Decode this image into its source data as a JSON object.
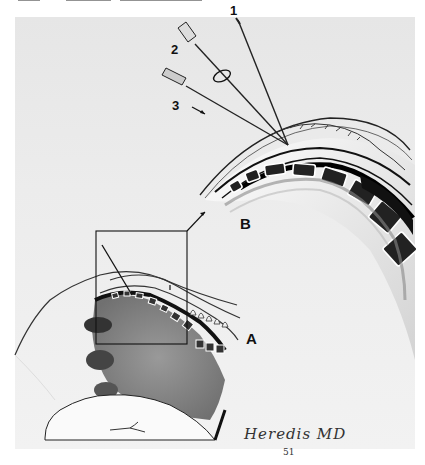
{
  "page": {
    "header_text": "",
    "header_clipped": true
  },
  "figure": {
    "labels": {
      "needle_1": "1",
      "needle_2": "2",
      "needle_3": "3",
      "detail_view": "B",
      "overview": "A"
    },
    "signature": "Heredis MD",
    "signature_number": "51",
    "colors": {
      "background_plate": "#e9e9e9",
      "ink": "#111111",
      "tissue_shade": "#7a7a7a",
      "page": "#ffffff"
    }
  }
}
